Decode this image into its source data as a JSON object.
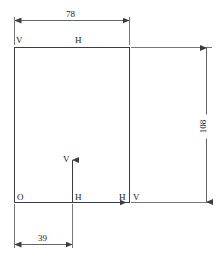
{
  "diagram": {
    "type": "engineering-dimension-drawing",
    "title": "",
    "line_color": "#3d3d3d",
    "text_color": "#1a1a1a",
    "background": "#ffffff",
    "shape": {
      "name": "rectangle",
      "width_label": "78",
      "height_label": "108"
    },
    "dimensions": [
      {
        "id": "top-width",
        "value": "78",
        "orientation": "horizontal",
        "position": "top"
      },
      {
        "id": "right-height",
        "value": "108",
        "orientation": "vertical",
        "position": "right"
      },
      {
        "id": "bottom-offset",
        "value": "39",
        "orientation": "horizontal",
        "position": "bottom"
      }
    ],
    "labels": {
      "origin": "O",
      "top_left_v": "V",
      "top_h": "H",
      "axis_v": "V",
      "axis_origin_h": "H",
      "axis_h_end": "H",
      "right_edge_v": "V"
    }
  }
}
